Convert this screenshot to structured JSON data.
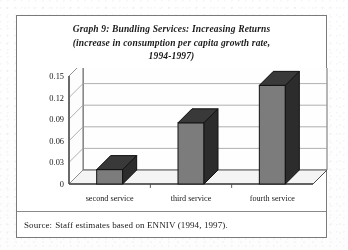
{
  "figure": {
    "title_lines": [
      "Graph 9: Bundling Services:  Increasing Returns",
      "(increase in consumption per capita growth rate,",
      "1994-1997)"
    ],
    "source_label": "Source:",
    "source_text": "Staff estimates based on ENNIV (1994, 1997)."
  },
  "chart_data": {
    "type": "bar",
    "title": "Graph 9: Bundling Services:  Increasing Returns (increase in consumption per capita growth rate, 1994-1997)",
    "categories": [
      "second service",
      "third service",
      "fourth service"
    ],
    "values": [
      0.02,
      0.085,
      0.137
    ],
    "series": [
      {
        "name": "increase in consumption per capita growth rate",
        "values": [
          0.02,
          0.085,
          0.137
        ]
      }
    ],
    "xlabel": "",
    "ylabel": "",
    "ylim": [
      0,
      0.15
    ],
    "yticks": [
      0,
      0.03,
      0.06,
      0.09,
      0.12,
      0.15
    ],
    "ytick_labels": [
      "0",
      "0.03",
      "0.06",
      "0.09",
      "0.12",
      "0.15"
    ],
    "grid": true,
    "legend": false,
    "style": "3d-column",
    "colors": {
      "bar_face": "#7c7c7c",
      "bar_top": "#3a3a3a",
      "bar_side": "#2e2e2e",
      "grid": "#9a9a9a",
      "axis": "#4a4a4a",
      "floor": "#f2f2f2",
      "wall": "#fcfcfc"
    }
  }
}
